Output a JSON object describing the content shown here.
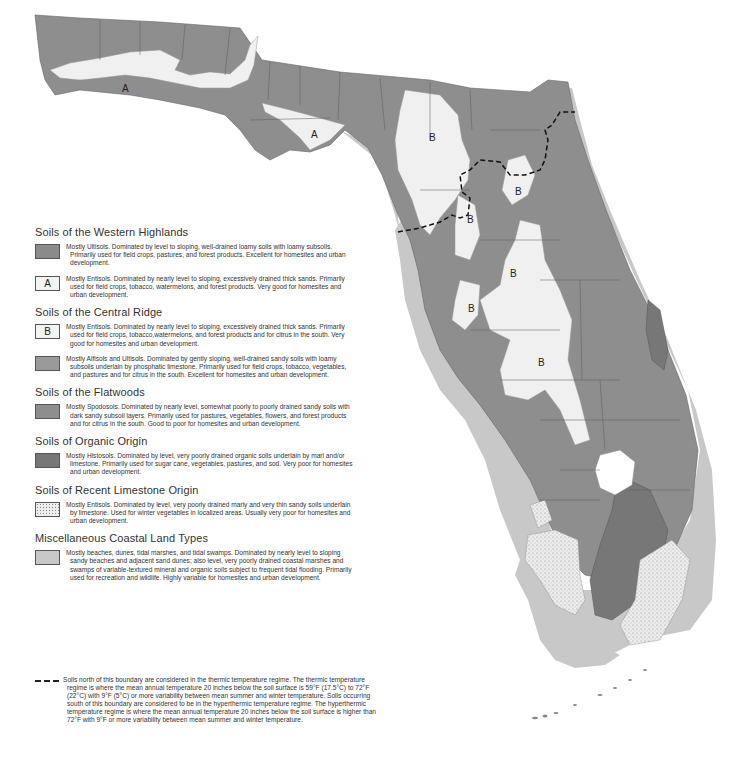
{
  "colors": {
    "western_highlands_ultisols": "#8a8a8a",
    "entisols_a": "#f0f0f0",
    "entisols_b": "#f0f0f0",
    "central_ridge_alfisols": "#9a9a9a",
    "flatwoods_spodosols": "#8e8e8e",
    "organic_histosols": "#777777",
    "recent_limestone": "#ececec",
    "coastal_land": "#c8c8c8",
    "county_lines": "#555555",
    "boundary_line": "#111111"
  },
  "map": {
    "labels": [
      {
        "text": "A",
        "x": 125,
        "y": 90
      },
      {
        "text": "A",
        "x": 315,
        "y": 138
      },
      {
        "text": "B",
        "x": 432,
        "y": 141
      },
      {
        "text": "B",
        "x": 518,
        "y": 195
      },
      {
        "text": "B",
        "x": 470,
        "y": 223
      },
      {
        "text": "B",
        "x": 513,
        "y": 277
      },
      {
        "text": "B",
        "x": 471,
        "y": 311
      },
      {
        "text": "B",
        "x": 541,
        "y": 366
      }
    ]
  },
  "legend": {
    "sections": [
      {
        "title": "Soils of the Western Highlands",
        "entries": [
          {
            "swatch": "western_highlands_ultisols",
            "symbol": "",
            "text": "Mostly Ultisols.  Dominated by level to sloping, well-drained loamy soils with loamy subsoils. Primarily used for field crops, pastures, and forest products. Excellent for homesites and urban development."
          },
          {
            "swatch": "entisols_a",
            "symbol": "A",
            "text": "Mostly Entisols. Dominated by nearly level to sloping, excessively drained thick sands. Primarily used for field crops, tobacco, watermelons, and forest products. Very good for homesites and urban development."
          }
        ]
      },
      {
        "title": "Soils of the Central Ridge",
        "entries": [
          {
            "swatch": "entisols_b",
            "symbol": "B",
            "text": "Mostly Entisols. Dominated by nearly level to sloping, excessively drained thick sands. Primarily used for field crops, tobacco,watermelons, and forest products and for citrus in the south. Very good for homesites and urban development."
          },
          {
            "swatch": "central_ridge_alfisols",
            "symbol": "",
            "text": "Mostly Alfisols and Ultisols. Dominated by gently sloping, well-drained sandy soils with loamy subsoils underlain by phosphatic limestone. Primarily used for field crops, tobacco, vegetables, and pastures and for citrus in the south. Excellent for homesites and urban development."
          }
        ]
      },
      {
        "title": "Soils of the Flatwoods",
        "entries": [
          {
            "swatch": "flatwoods_spodosols",
            "symbol": "",
            "text": "Mostly Spodosols. Dominated by nearly level, somewhat poorly to poorly drained sandy soils with dark sandy subsoil layers. Primarily used for pastures, vegetables, flowers, and forest products and for citrus in the south. Good to poor for homesites and urban development."
          }
        ]
      },
      {
        "title": "Soils of Organic Origin",
        "entries": [
          {
            "swatch": "organic_histosols",
            "symbol": "",
            "text": "Mostly Histosols. Dominated by level, very poorly drained organic soils underlain by marl and/or limestone. Primarily used for sugar cane, vegetables, pastures, and sod.  Very poor for homesites and urban development."
          }
        ]
      },
      {
        "title": "Soils of Recent Limestone Origin",
        "entries": [
          {
            "swatch": "recent_limestone",
            "symbol": "",
            "dotted": true,
            "text": "Mostly Entisols. Dominated by level, very poorly drained marly and very thin sandy soils underlain by limestone. Used for winter vegetables in localized areas. Usually very poor for homesites and urban development."
          }
        ]
      },
      {
        "title": "Miscellaneous Coastal Land Types",
        "entries": [
          {
            "swatch": "coastal_land",
            "symbol": "",
            "text": "Mostly beaches, dunes, tidal marshes, and tidal swamps. Dominated by nearly level to sloping sandy beaches and adjacent sand dunes; also level, very poorly drained coastal marshes and swamps of variable-textured mineral and organic soils subject to frequent tidal flooding. Primarily used for recreation and wildlife.  Highly variable for homesites and urban development."
          }
        ]
      }
    ],
    "boundary_note": "Soils north of this boundary are considered in the thermic temperature regime. The thermic temperature regime is where the mean annual temperature 20 inches below the soil surface is 59°F (17.5°C) to 72°F (22°C) with 9°F (5°C) or more variability between mean summer and winter temperature. Soils occurring south of this boundary are considered to be in the hyperthermic temperature regime. The hyperthermic temperature  regime is where the mean annual temperature 20 inches below the soil surface is higher than 72°F with 9°F or more variability between mean summer and winter temperature."
  }
}
